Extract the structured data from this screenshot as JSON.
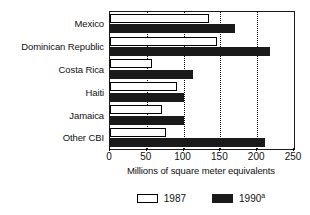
{
  "chart_data": {
    "type": "bar",
    "orientation": "horizontal",
    "title": "",
    "xlabel": "Millions of square meter equivalents",
    "ylabel": "",
    "xlim": [
      0,
      250
    ],
    "xticks": [
      0,
      50,
      100,
      150,
      200,
      250
    ],
    "xtick_labels": [
      "0",
      "50",
      "100",
      "150",
      "200",
      "250"
    ],
    "grid": true,
    "grid_axis": "x",
    "grid_style": "dotted",
    "legend_position": "bottom-center",
    "categories": [
      "Mexico",
      "Dominican Republic",
      "Costa Rica",
      "Haiti",
      "Jamaica",
      "Other CBI"
    ],
    "series": [
      {
        "name": "1987",
        "color": "#ffffff",
        "edge_color": "#000000",
        "values": [
          135,
          145,
          57,
          91,
          70,
          76
        ]
      },
      {
        "name": "1990",
        "name_superscript": "a",
        "color": "#1a1a1a",
        "edge_color": "#1a1a1a",
        "values": [
          170,
          218,
          113,
          100,
          100,
          210
        ]
      }
    ],
    "legend": [
      {
        "label": "1987",
        "superscript": ""
      },
      {
        "label": "1990",
        "superscript": "a"
      }
    ]
  },
  "colors": {
    "axis": "#1a1a1a",
    "grid": "#000000",
    "bar_1987_fill": "#ffffff",
    "bar_1990_fill": "#1a1a1a",
    "text": "#111111",
    "background": "#ffffff"
  }
}
